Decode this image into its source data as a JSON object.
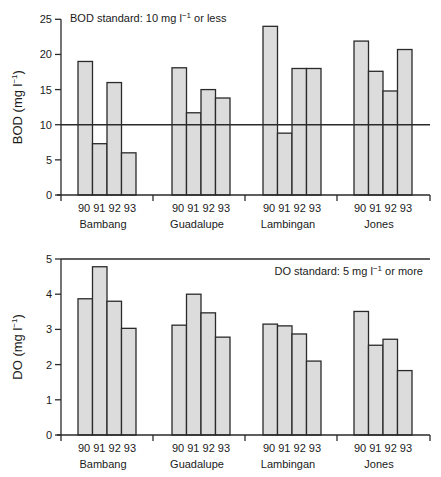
{
  "chart_data": [
    {
      "type": "bar",
      "panel": "top",
      "title": "",
      "xlabel": "",
      "ylabel": "BOD (mg l-1)",
      "ylabel_parts": {
        "main": "BOD  (mg l",
        "sup": "−1",
        "close": ")"
      },
      "ylim": [
        0,
        25
      ],
      "yticks": [
        0,
        5,
        10,
        15,
        20,
        25
      ],
      "grid": false,
      "groups": [
        "Bambang",
        "Guadalupe",
        "Lambingan",
        "Jones"
      ],
      "categories": [
        "90",
        "91",
        "92",
        "93"
      ],
      "series": [
        {
          "name": "Bambang",
          "values": [
            19,
            7.3,
            16,
            6
          ]
        },
        {
          "name": "Guadalupe",
          "values": [
            18.1,
            11.7,
            15,
            13.8
          ]
        },
        {
          "name": "Lambingan",
          "values": [
            24,
            8.8,
            18,
            18
          ]
        },
        {
          "name": "Jones",
          "values": [
            21.9,
            17.6,
            14.8,
            20.7
          ]
        }
      ],
      "reference_line": {
        "value": 10,
        "label": "BOD standard: 10 mg l−1 or less"
      },
      "annotation": {
        "main": "BOD standard: 10 mg l",
        "sup": "−1",
        "tail": " or less"
      }
    },
    {
      "type": "bar",
      "panel": "bottom",
      "title": "",
      "xlabel": "",
      "ylabel": "DO (mg l-1)",
      "ylabel_parts": {
        "main": "DO  (mg l",
        "sup": "−1",
        "close": ")"
      },
      "ylim": [
        0,
        5
      ],
      "yticks": [
        0,
        1,
        2,
        3,
        4,
        5
      ],
      "grid": false,
      "groups": [
        "Bambang",
        "Guadalupe",
        "Lambingan",
        "Jones"
      ],
      "categories": [
        "90",
        "91",
        "92",
        "93"
      ],
      "series": [
        {
          "name": "Bambang",
          "values": [
            3.87,
            4.78,
            3.8,
            3.03
          ]
        },
        {
          "name": "Guadalupe",
          "values": [
            3.12,
            4.0,
            3.47,
            2.78
          ]
        },
        {
          "name": "Lambingan",
          "values": [
            3.15,
            3.1,
            2.87,
            2.1
          ]
        },
        {
          "name": "Jones",
          "values": [
            3.51,
            2.55,
            2.72,
            1.83
          ]
        }
      ],
      "reference_line": {
        "value": 5,
        "label": "DO standard: 5 mg l−1 or more"
      },
      "annotation": {
        "main": "DO standard: 5 mg l",
        "sup": "−1",
        "tail": " or more"
      }
    }
  ],
  "colors": {
    "bar_fill": "#dcdcdc",
    "stroke": "#2a2a2a"
  }
}
